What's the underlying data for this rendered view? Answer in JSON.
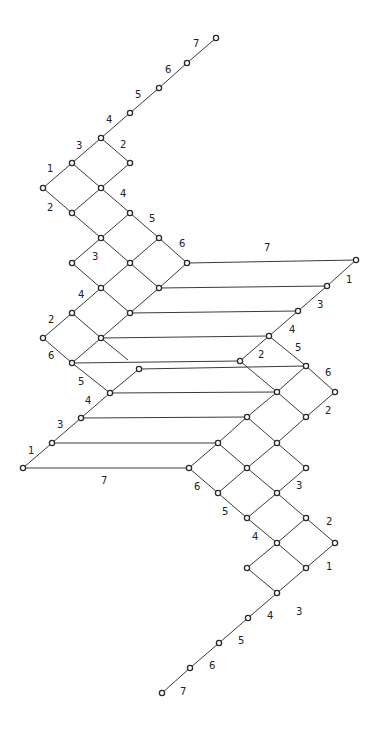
{
  "diagram": {
    "type": "lattice-graph",
    "colors": {
      "background": "#ffffff",
      "edge": "#3a3a3a",
      "node_stroke": "#2a2a2a",
      "label": "#222222"
    },
    "nodes": [
      [
        216,
        38
      ],
      [
        187,
        63
      ],
      [
        159,
        88
      ],
      [
        130,
        113
      ],
      [
        101,
        138
      ],
      [
        72,
        163
      ],
      [
        130,
        163
      ],
      [
        43,
        188
      ],
      [
        101,
        188
      ],
      [
        72,
        213
      ],
      [
        130,
        213
      ],
      [
        101,
        238
      ],
      [
        159,
        238
      ],
      [
        72,
        263
      ],
      [
        130,
        263
      ],
      [
        187,
        263
      ],
      [
        101,
        288
      ],
      [
        159,
        288
      ],
      [
        72,
        313
      ],
      [
        130,
        313
      ],
      [
        43,
        338
      ],
      [
        101,
        338
      ],
      [
        72,
        363
      ],
      [
        139,
        369
      ],
      [
        110,
        393
      ],
      [
        81,
        418
      ],
      [
        52,
        443
      ],
      [
        23,
        468
      ],
      [
        356,
        260
      ],
      [
        327,
        286
      ],
      [
        298,
        311
      ],
      [
        269,
        336
      ],
      [
        240,
        361
      ],
      [
        306,
        366
      ],
      [
        277,
        392
      ],
      [
        335,
        392
      ],
      [
        247,
        417
      ],
      [
        306,
        417
      ],
      [
        218,
        443
      ],
      [
        277,
        443
      ],
      [
        189,
        468
      ],
      [
        247,
        468
      ],
      [
        306,
        468
      ],
      [
        218,
        493
      ],
      [
        277,
        493
      ],
      [
        247,
        518
      ],
      [
        306,
        518
      ],
      [
        277,
        543
      ],
      [
        335,
        543
      ],
      [
        247,
        568
      ],
      [
        306,
        568
      ],
      [
        277,
        593
      ],
      [
        248,
        618
      ],
      [
        219,
        643
      ],
      [
        190,
        668
      ],
      [
        162,
        693
      ]
    ],
    "edges": [
      [
        216,
        38,
        187,
        63
      ],
      [
        187,
        63,
        159,
        88
      ],
      [
        159,
        88,
        130,
        113
      ],
      [
        130,
        113,
        101,
        138
      ],
      [
        101,
        138,
        72,
        163
      ],
      [
        101,
        138,
        130,
        163
      ],
      [
        72,
        163,
        43,
        188
      ],
      [
        72,
        163,
        101,
        188
      ],
      [
        130,
        163,
        101,
        188
      ],
      [
        43,
        188,
        72,
        213
      ],
      [
        101,
        188,
        72,
        213
      ],
      [
        101,
        188,
        130,
        213
      ],
      [
        72,
        213,
        101,
        238
      ],
      [
        130,
        213,
        101,
        238
      ],
      [
        130,
        213,
        159,
        238
      ],
      [
        101,
        238,
        72,
        263
      ],
      [
        101,
        238,
        130,
        263
      ],
      [
        159,
        238,
        130,
        263
      ],
      [
        159,
        238,
        187,
        263
      ],
      [
        72,
        263,
        101,
        288
      ],
      [
        130,
        263,
        101,
        288
      ],
      [
        130,
        263,
        159,
        288
      ],
      [
        187,
        263,
        159,
        288
      ],
      [
        101,
        288,
        72,
        313
      ],
      [
        101,
        288,
        130,
        313
      ],
      [
        159,
        288,
        130,
        313
      ],
      [
        72,
        313,
        43,
        338
      ],
      [
        72,
        313,
        101,
        338
      ],
      [
        130,
        313,
        101,
        338
      ],
      [
        43,
        338,
        72,
        363
      ],
      [
        101,
        338,
        72,
        363
      ],
      [
        101,
        338,
        128,
        360
      ],
      [
        72,
        363,
        110,
        393
      ],
      [
        139,
        369,
        110,
        393
      ],
      [
        110,
        393,
        81,
        418
      ],
      [
        81,
        418,
        52,
        443
      ],
      [
        52,
        443,
        23,
        468
      ],
      [
        356,
        260,
        327,
        286
      ],
      [
        327,
        286,
        298,
        311
      ],
      [
        298,
        311,
        269,
        336
      ],
      [
        269,
        336,
        240,
        361
      ],
      [
        269,
        336,
        306,
        366
      ],
      [
        240,
        361,
        277,
        392
      ],
      [
        306,
        366,
        277,
        392
      ],
      [
        306,
        366,
        335,
        392
      ],
      [
        277,
        392,
        247,
        417
      ],
      [
        277,
        392,
        306,
        417
      ],
      [
        335,
        392,
        306,
        417
      ],
      [
        247,
        417,
        218,
        443
      ],
      [
        247,
        417,
        277,
        443
      ],
      [
        306,
        417,
        277,
        443
      ],
      [
        218,
        443,
        189,
        468
      ],
      [
        218,
        443,
        247,
        468
      ],
      [
        277,
        443,
        247,
        468
      ],
      [
        277,
        443,
        306,
        468
      ],
      [
        189,
        468,
        218,
        493
      ],
      [
        247,
        468,
        218,
        493
      ],
      [
        247,
        468,
        277,
        493
      ],
      [
        306,
        468,
        277,
        493
      ],
      [
        218,
        493,
        247,
        518
      ],
      [
        277,
        493,
        247,
        518
      ],
      [
        277,
        493,
        306,
        518
      ],
      [
        247,
        518,
        277,
        543
      ],
      [
        306,
        518,
        277,
        543
      ],
      [
        306,
        518,
        335,
        543
      ],
      [
        277,
        543,
        247,
        568
      ],
      [
        277,
        543,
        306,
        568
      ],
      [
        335,
        543,
        306,
        568
      ],
      [
        247,
        568,
        277,
        593
      ],
      [
        306,
        568,
        277,
        593
      ],
      [
        277,
        593,
        248,
        618
      ],
      [
        248,
        618,
        219,
        643
      ],
      [
        219,
        643,
        190,
        668
      ],
      [
        190,
        668,
        162,
        693
      ],
      [
        187,
        263,
        356,
        260
      ],
      [
        159,
        288,
        327,
        286
      ],
      [
        130,
        313,
        298,
        311
      ],
      [
        101,
        338,
        269,
        336
      ],
      [
        72,
        363,
        240,
        361
      ],
      [
        139,
        369,
        306,
        366
      ],
      [
        110,
        393,
        277,
        392
      ],
      [
        81,
        418,
        247,
        417
      ],
      [
        52,
        443,
        218,
        443
      ],
      [
        23,
        468,
        189,
        468
      ]
    ],
    "labels": [
      {
        "text": "7",
        "x": 193,
        "y": 47
      },
      {
        "text": "6",
        "x": 165,
        "y": 73
      },
      {
        "text": "5",
        "x": 135,
        "y": 98
      },
      {
        "text": "4",
        "x": 106,
        "y": 123
      },
      {
        "text": "3",
        "x": 76,
        "y": 149
      },
      {
        "text": "2",
        "x": 120,
        "y": 148
      },
      {
        "text": "1",
        "x": 47,
        "y": 172
      },
      {
        "text": "4",
        "x": 120,
        "y": 197
      },
      {
        "text": "2",
        "x": 47,
        "y": 211
      },
      {
        "text": "5",
        "x": 149,
        "y": 222
      },
      {
        "text": "3",
        "x": 92,
        "y": 260
      },
      {
        "text": "6",
        "x": 179,
        "y": 247
      },
      {
        "text": "4",
        "x": 78,
        "y": 298
      },
      {
        "text": "2",
        "x": 48,
        "y": 323
      },
      {
        "text": "6",
        "x": 48,
        "y": 359
      },
      {
        "text": "5",
        "x": 78,
        "y": 385
      },
      {
        "text": "4",
        "x": 85,
        "y": 404
      },
      {
        "text": "3",
        "x": 57,
        "y": 428
      },
      {
        "text": "1",
        "x": 28,
        "y": 454
      },
      {
        "text": "7",
        "x": 101,
        "y": 484
      },
      {
        "text": "7",
        "x": 264,
        "y": 251
      },
      {
        "text": "1",
        "x": 346,
        "y": 283
      },
      {
        "text": "3",
        "x": 317,
        "y": 308
      },
      {
        "text": "4",
        "x": 289,
        "y": 333
      },
      {
        "text": "5",
        "x": 295,
        "y": 351
      },
      {
        "text": "2",
        "x": 258,
        "y": 358
      },
      {
        "text": "6",
        "x": 325,
        "y": 376
      },
      {
        "text": "2",
        "x": 325,
        "y": 414
      },
      {
        "text": "3",
        "x": 296,
        "y": 489
      },
      {
        "text": "6",
        "x": 194,
        "y": 490
      },
      {
        "text": "5",
        "x": 222,
        "y": 515
      },
      {
        "text": "4",
        "x": 252,
        "y": 540
      },
      {
        "text": "2",
        "x": 326,
        "y": 525
      },
      {
        "text": "1",
        "x": 326,
        "y": 570
      },
      {
        "text": "3",
        "x": 296,
        "y": 615
      },
      {
        "text": "4",
        "x": 267,
        "y": 619
      },
      {
        "text": "5",
        "x": 238,
        "y": 644
      },
      {
        "text": "6",
        "x": 209,
        "y": 669
      },
      {
        "text": "7",
        "x": 180,
        "y": 695
      }
    ]
  }
}
